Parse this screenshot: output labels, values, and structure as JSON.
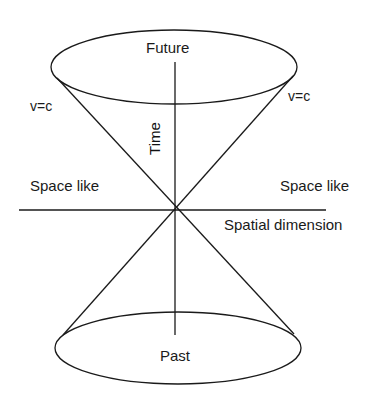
{
  "diagram": {
    "labels": {
      "future": "Future",
      "past": "Past",
      "time": "Time",
      "vc_left": "v=c",
      "vc_right": "v=c",
      "spacelike_left": "Space like",
      "spacelike_right": "Space like",
      "spatial_dimension": "Spatial dimension"
    },
    "colors": {
      "line": "#1a1a1a",
      "background": "#ffffff"
    }
  }
}
